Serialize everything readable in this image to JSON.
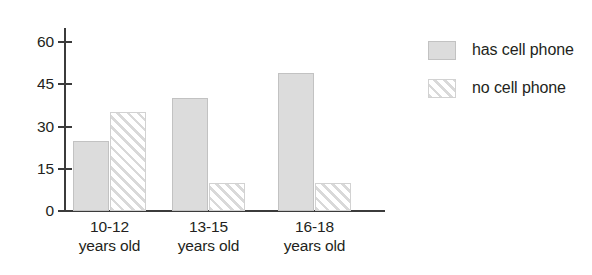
{
  "chart_data": {
    "type": "bar",
    "title": "",
    "subtitle": "",
    "xlabel": "",
    "ylabel": "",
    "grid": false,
    "legend_position": "right",
    "categories": [
      "10-12\nyears old",
      "13-15\nyears old",
      "16-18\nyears old"
    ],
    "category_lines": [
      [
        "10-12",
        "years old"
      ],
      [
        "13-15",
        "years old"
      ],
      [
        "16-18",
        "years old"
      ]
    ],
    "series": [
      {
        "name": "has cell phone",
        "values": [
          25,
          40,
          49
        ],
        "fill": "solid",
        "color": "#dcdcdc"
      },
      {
        "name": "no cell phone",
        "values": [
          35,
          10,
          10
        ],
        "fill": "diagonal-hatch",
        "color": "#d9d9d9"
      }
    ],
    "ylim": [
      0,
      66
    ],
    "yticks": [
      0,
      15,
      30,
      45,
      60
    ],
    "ytick_labels": [
      "0",
      "15",
      "30",
      "45",
      "60"
    ],
    "axis_color": "#3b3b3b",
    "text_color": "#231f20",
    "background": "#ffffff"
  },
  "legend": {
    "items": [
      {
        "label": "has cell phone",
        "swatch": "solid-gray-swatch"
      },
      {
        "label": "no cell phone",
        "swatch": "hatched-swatch"
      }
    ]
  }
}
